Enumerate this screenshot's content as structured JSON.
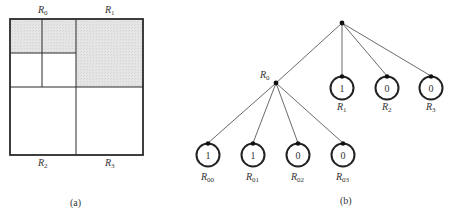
{
  "figure": {
    "panel_a": {
      "caption": "(a)",
      "shading_color": "#e4e4e4",
      "region_labels": [
        {
          "id": "R0",
          "base": "R",
          "sub": "0",
          "x": 42,
          "y": 13
        },
        {
          "id": "R1",
          "base": "R",
          "sub": "1",
          "x": 109,
          "y": 13
        },
        {
          "id": "R2",
          "base": "R",
          "sub": "2",
          "x": 42,
          "y": 166
        },
        {
          "id": "R3",
          "base": "R",
          "sub": "3",
          "x": 109,
          "y": 166
        }
      ],
      "shaded_regions": [
        "R00",
        "R01",
        "R1"
      ]
    },
    "panel_b": {
      "caption": "(b)",
      "root": {
        "x": 342,
        "y": 23
      },
      "internal_node": {
        "id": "R0",
        "base": "R",
        "sub": "0",
        "x": 276,
        "y": 83
      },
      "level1_leaves": [
        {
          "id": "R1",
          "base": "R",
          "sub": "1",
          "value": "1",
          "cx": 342,
          "cy": 88
        },
        {
          "id": "R2",
          "base": "R",
          "sub": "2",
          "value": "0",
          "cx": 387,
          "cy": 88
        },
        {
          "id": "R3",
          "base": "R",
          "sub": "3",
          "value": "0",
          "cx": 431,
          "cy": 88
        }
      ],
      "level2_leaves": [
        {
          "id": "R00",
          "base": "R",
          "sub": "00",
          "value": "1",
          "cx": 208,
          "cy": 155
        },
        {
          "id": "R01",
          "base": "R",
          "sub": "01",
          "value": "1",
          "cx": 253,
          "cy": 155
        },
        {
          "id": "R02",
          "base": "R",
          "sub": "02",
          "value": "0",
          "cx": 298,
          "cy": 155
        },
        {
          "id": "R03",
          "base": "R",
          "sub": "03",
          "value": "0",
          "cx": 343,
          "cy": 155
        }
      ]
    }
  }
}
